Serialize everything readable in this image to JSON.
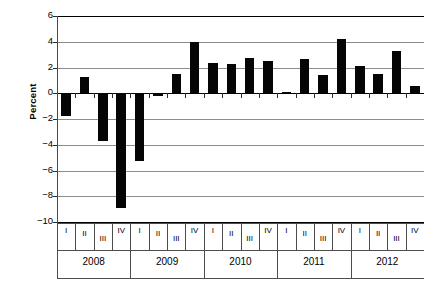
{
  "chart_data": {
    "type": "bar",
    "title": "",
    "subtitle": "",
    "xlabel": "",
    "ylabel": "Percent",
    "ylim": [
      -10,
      6
    ],
    "ytick_step": 2,
    "yticks": [
      6,
      4,
      2,
      0,
      -2,
      -4,
      -6,
      -8,
      -10
    ],
    "ytick_labels": [
      "6",
      "4",
      "2",
      "0",
      "−2",
      "−4",
      "−6",
      "−8",
      "−10"
    ],
    "grid": true,
    "grid_axis": "y",
    "legend": false,
    "bar_color": "#050505",
    "grid_color": "#8c8c8c",
    "axis_color": "#4a4a4a",
    "categories": [
      "I",
      "II",
      "III",
      "IV",
      "I",
      "II",
      "III",
      "IV",
      "I",
      "II",
      "III",
      "IV",
      "I",
      "II",
      "III",
      "IV",
      "I",
      "II",
      "III",
      "IV"
    ],
    "groups": [
      {
        "label": "2008",
        "quarters": [
          "I",
          "II",
          "III",
          "IV"
        ]
      },
      {
        "label": "2009",
        "quarters": [
          "I",
          "II",
          "III",
          "IV"
        ]
      },
      {
        "label": "2010",
        "quarters": [
          "I",
          "II",
          "III",
          "IV"
        ]
      },
      {
        "label": "2011",
        "quarters": [
          "I",
          "II",
          "III",
          "IV"
        ]
      },
      {
        "label": "2012",
        "quarters": [
          "I",
          "II",
          "III",
          "IV"
        ]
      }
    ],
    "values": [
      -1.8,
      1.3,
      -3.7,
      -8.9,
      -5.3,
      -0.2,
      1.5,
      4.0,
      2.35,
      2.3,
      2.7,
      2.5,
      0.1,
      2.65,
      1.45,
      4.25,
      2.1,
      1.5,
      3.3,
      0.55
    ],
    "value_labels": [
      "-1.8",
      "1.3",
      "-3.7",
      "-8.9",
      "-5.3",
      "-0.2",
      "1.5",
      "4.0",
      "2.4",
      "2.3",
      "2.7",
      "2.5",
      "0.1",
      "2.7",
      "1.5",
      "4.3",
      "2.1",
      "1.5",
      "3.3",
      "0.6"
    ]
  },
  "axis": {
    "y_title": "Percent"
  }
}
